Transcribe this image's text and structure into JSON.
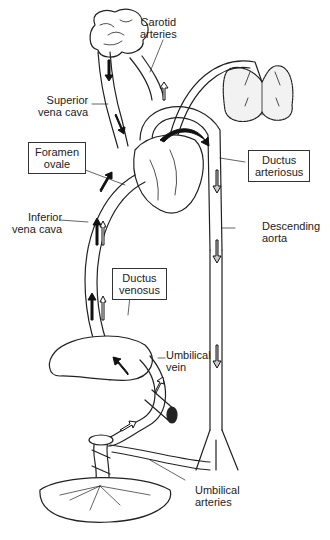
{
  "diagram": {
    "colors": {
      "line": "#222222",
      "oxygenated_arrow": "#111111",
      "mixed_arrow": "#ffffff",
      "lung_fill": "#f2f2f2",
      "background": "#ffffff"
    },
    "labels": {
      "carotid_arteries": {
        "line1": "Carotid",
        "line2": "arteries"
      },
      "superior_vena_cava": {
        "line1": "Superior",
        "line2": "vena cava"
      },
      "foramen_ovale": {
        "line1": "Foramen",
        "line2": "ovale"
      },
      "ductus_arteriosus": {
        "line1": "Ductus",
        "line2": "arteriosus"
      },
      "inferior_vena_cava": {
        "line1": "Inferior",
        "line2": "vena cava"
      },
      "descending_aorta": {
        "line1": "Descending",
        "line2": "aorta"
      },
      "ductus_venosus": {
        "line1": "Ductus",
        "line2": "venosus"
      },
      "umbilical_vein": {
        "line1": "Umbilical",
        "line2": "vein"
      },
      "umbilical_arteries": {
        "line1": "Umbilical",
        "line2": "arteries"
      }
    },
    "structures": [
      "brain",
      "lungs",
      "heart",
      "liver",
      "placenta",
      "umbilical cord",
      "descending aorta",
      "inferior vena cava",
      "superior vena cava"
    ]
  }
}
